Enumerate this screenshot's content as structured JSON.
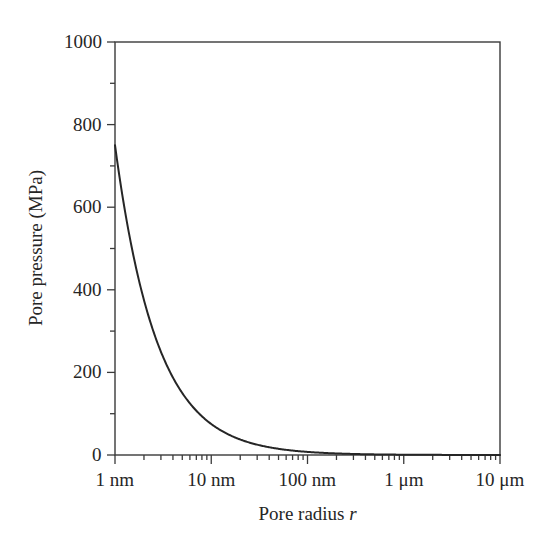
{
  "chart_data": {
    "type": "line",
    "title": "",
    "xlabel": "Pore radius r",
    "ylabel": "Pore pressure (MPa)",
    "xscale": "log",
    "yscale": "linear",
    "xlim_nm": [
      1,
      10000
    ],
    "ylim": [
      0,
      1000
    ],
    "grid": false,
    "legend": null,
    "x_unit": "nm",
    "y_unit": "MPa",
    "x_tick_labels": [
      "1 nm",
      "10 nm",
      "100 nm",
      "1 μm",
      "10 μm"
    ],
    "x_tick_values_nm": [
      1,
      10,
      100,
      1000,
      10000
    ],
    "y_tick_labels": [
      "0",
      "200",
      "400",
      "600",
      "800",
      "1000"
    ],
    "y_tick_values": [
      0,
      200,
      400,
      600,
      800,
      1000
    ],
    "y_minor_tick_values": [
      100,
      300,
      500,
      700,
      900
    ],
    "x_minor_multipliers": [
      2,
      3,
      4,
      5,
      6,
      7,
      8,
      9
    ],
    "series": [
      {
        "name": "pore pressure",
        "relation": "P = 750 / r  (r in nm, P in MPa)",
        "color": "#262626",
        "line_width": 2,
        "x_nm": [
          1,
          1.2,
          1.5,
          1.8,
          2,
          2.5,
          3,
          3.5,
          4,
          5,
          6,
          7,
          8,
          9,
          10,
          12,
          15,
          20,
          25,
          30,
          40,
          50,
          60,
          80,
          100,
          150,
          200,
          300,
          400,
          500,
          700,
          1000,
          1500
        ],
        "values": [
          750,
          625,
          500,
          417,
          375,
          300,
          250,
          214,
          188,
          150,
          125,
          107,
          94,
          83,
          75,
          63,
          50,
          38,
          30,
          25,
          19,
          15,
          13,
          9,
          8,
          5,
          4,
          3,
          2,
          2,
          1,
          1,
          0
        ]
      }
    ],
    "annotations": []
  },
  "axes_geometry": {
    "plot_left_px": 115,
    "plot_right_px": 500,
    "plot_top_px": 42,
    "plot_bottom_px": 455,
    "box_color": "#3a3a3a",
    "box_line_width": 1.4,
    "tick_direction": "out"
  },
  "figure": {
    "background": "#ffffff",
    "width_px": 553,
    "height_px": 549
  }
}
